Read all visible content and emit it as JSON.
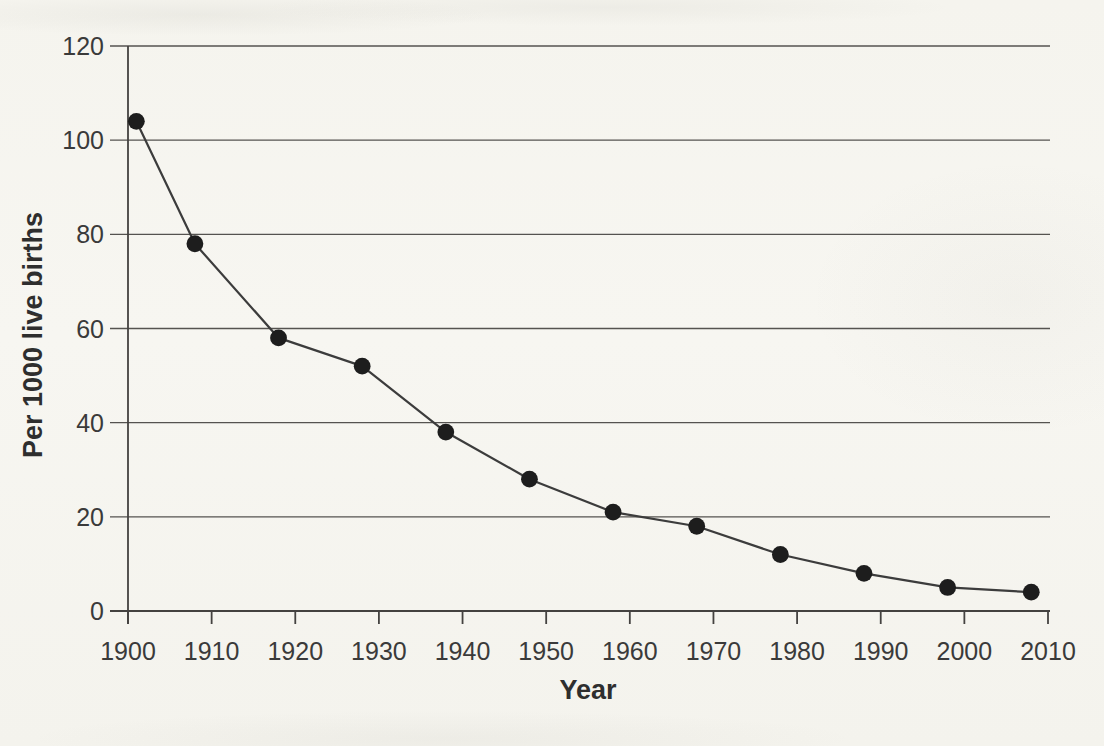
{
  "chart_data": {
    "type": "line",
    "xlabel": "Year",
    "ylabel": "Per 1000 live births",
    "x": [
      1901,
      1908,
      1918,
      1928,
      1938,
      1948,
      1958,
      1968,
      1978,
      1988,
      1998,
      2008
    ],
    "values": [
      104,
      78,
      58,
      52,
      38,
      28,
      21,
      18,
      12,
      8,
      5,
      4
    ],
    "xlim": [
      1900,
      2010
    ],
    "ylim": [
      0,
      120
    ],
    "x_ticks": [
      1900,
      1910,
      1920,
      1930,
      1940,
      1950,
      1960,
      1970,
      1980,
      1990,
      2000,
      2010
    ],
    "y_ticks": [
      0,
      20,
      40,
      60,
      80,
      100,
      120
    ],
    "grid": "horizontal",
    "legend": "none",
    "marker": "filled-circle",
    "colors": {
      "line": "#3c3c3c",
      "marker": "#1d1d1d",
      "grid": "#555350",
      "axis": "#444240",
      "text": "#3a3a3a",
      "paper": "#f6f5f0"
    }
  }
}
